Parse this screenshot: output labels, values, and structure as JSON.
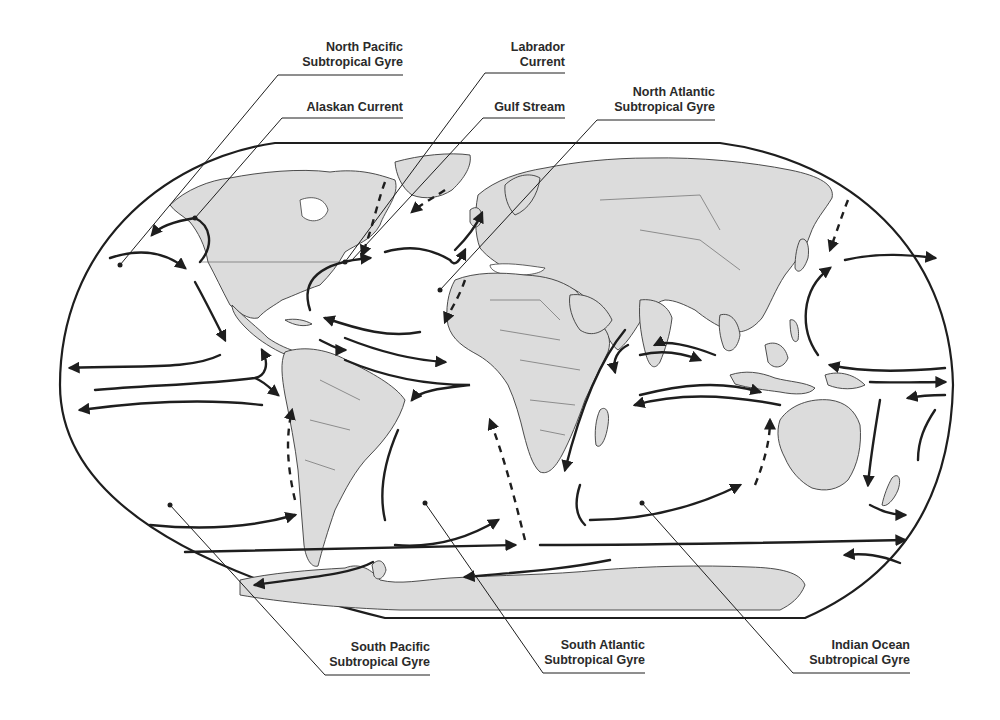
{
  "figure": {
    "type": "world map of ocean surface currents and subtropical gyres",
    "colors": {
      "background": "#ffffff",
      "land": "#dcdcdc",
      "outline": "#3a3a3a",
      "current_arrows": "#1e1e1e",
      "label_text": "#2a2a2a"
    }
  },
  "labels": {
    "north_pacific_gyre": {
      "line1": "North Pacific",
      "line2": "Subtropical Gyre"
    },
    "alaskan_current": {
      "line1": "Alaskan Current"
    },
    "labrador_current": {
      "line1": "Labrador",
      "line2": "Current"
    },
    "gulf_stream": {
      "line1": "Gulf Stream"
    },
    "north_atlantic_gyre": {
      "line1": "North Atlantic",
      "line2": "Subtropical Gyre"
    },
    "south_pacific_gyre": {
      "line1": "South Pacific",
      "line2": "Subtropical Gyre"
    },
    "south_atlantic_gyre": {
      "line1": "South Atlantic",
      "line2": "Subtropical Gyre"
    },
    "indian_ocean_gyre": {
      "line1": "Indian Ocean",
      "line2": "Subtropical Gyre"
    }
  },
  "legend": {
    "solid_arrow": "warm/surface current",
    "dashed_arrow": "cold current"
  }
}
